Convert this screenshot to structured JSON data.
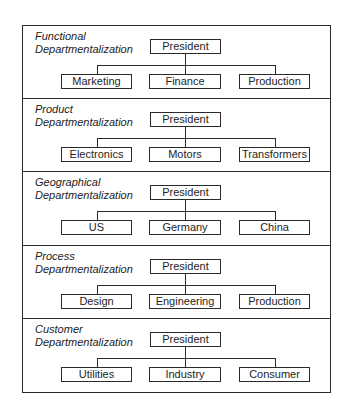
{
  "diagram": {
    "sections": [
      {
        "label_line1": "Functional",
        "label_line2": "Departmentalization",
        "root": "President",
        "children": [
          "Marketing",
          "Finance",
          "Production"
        ]
      },
      {
        "label_line1": "Product",
        "label_line2": "Departmentalization",
        "root": "President",
        "children": [
          "Electronics",
          "Motors",
          "Transformers"
        ]
      },
      {
        "label_line1": "Geographical",
        "label_line2": "Departmentalization",
        "root": "President",
        "children": [
          "US",
          "Germany",
          "China"
        ]
      },
      {
        "label_line1": "Process",
        "label_line2": "Departmentalization",
        "root": "President",
        "children": [
          "Design",
          "Engineering",
          "Production"
        ]
      },
      {
        "label_line1": "Customer",
        "label_line2": "Departmentalization",
        "root": "President",
        "children": [
          "Utilities",
          "Industry",
          "Consumer"
        ]
      }
    ]
  },
  "colors": {
    "line": "#2a2a2a",
    "background": "#ffffff",
    "text": "#1e1e1e"
  }
}
